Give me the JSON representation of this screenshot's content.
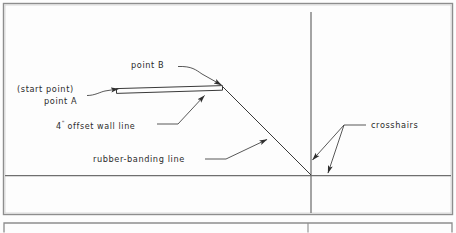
{
  "figure": {
    "name": "cad-rubber-banding-diagram",
    "background_color": "#fdfdfd",
    "ink_color": "#3a3a3a",
    "text_color": "#2b2b2b"
  },
  "annotations": {
    "start_point": "(start point)",
    "point_a": "point A",
    "offset_wall_number": "4",
    "offset_wall_inch_mark": "\"",
    "offset_wall_rest": " offset wall line",
    "point_b": "point B",
    "rubber_banding": "rubber-banding line",
    "crosshairs": "crosshairs"
  },
  "drawing": {
    "outer_frame_label": "drawing-viewport-frame",
    "floor_line_label": "horizontal-crosshair-line",
    "vertical_line_label": "vertical-crosshair-line",
    "wall_label": "offset-wall-rectangle",
    "rubber_band_label": "rubber-banding-line",
    "second_frame_label": "lower-viewport-frame"
  }
}
